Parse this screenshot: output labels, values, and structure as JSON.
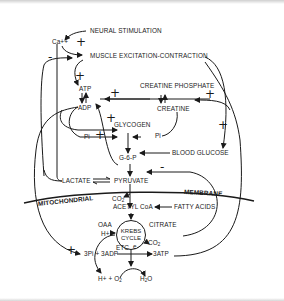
{
  "diagram": {
    "type": "metabolic-regulation-flowchart",
    "nodes": {
      "neural_stimulation": "NEURAL STIMULATION",
      "calcium": "Ca++",
      "muscle_excitation": "MUSCLE EXCITATION-CONTRACTION",
      "creatine_phosphate": "CREATINE PHOSPHATE",
      "creatine": "CREATINE",
      "atp": "ATP",
      "adp": "ADP",
      "pi_left": "Pi",
      "pi_right": "Pi",
      "glycogen": "GLYCOGEN",
      "g6p": "G-6-P",
      "blood_glucose": "BLOOD GLUCOSE",
      "lactate": "LACTATE",
      "pyruvate": "PYRUVATE",
      "mitochondrial": "MITOCHONDRIAL",
      "membrane": "MEMBRANE",
      "co2_top": "CO",
      "co2_top_sub": "2",
      "acetyl_coa": "ACETYL CoA",
      "fatty_acids": "FATTY ACIDS",
      "oaa": "OAA",
      "krebs_line1": "KREBS",
      "krebs_line2": "CYCLE",
      "citrate": "CITRATE",
      "h_plus": "H+",
      "co2_right": "CO",
      "co2_right_sub": "2",
      "etc": "ETC",
      "e_minus": "e-",
      "pi_adp": "3Pi + 3ADP",
      "atp3": "3ATP",
      "h_o2": "H+ + O",
      "h_o2_sub": "2",
      "h2o_h": "H",
      "h2o_sub": "2",
      "h2o_o": "O"
    },
    "signs": {
      "ca_plus": "+",
      "ca_minus": "-",
      "excitation_plus": "+",
      "adp_plus": "+",
      "creatine_plus": "+",
      "atp_plus": "+",
      "pi_plus": "+",
      "glucose_plus": "+",
      "pyruvate_minus": "-",
      "mito_plus": "+"
    }
  }
}
